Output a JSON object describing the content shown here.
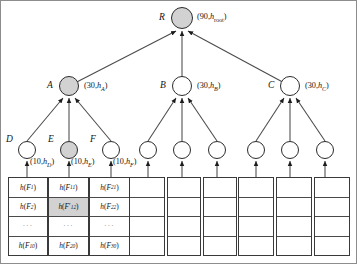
{
  "diagram": {
    "colors": {
      "shade": "#d2d2d2",
      "stroke": "#2b2b2b",
      "frame": "#8d8d8d"
    },
    "root": {
      "name": "R",
      "pair": "(90,h_root)",
      "shaded": true
    },
    "mid_nodes": [
      {
        "name": "A",
        "pair": "(30,h_A)",
        "shaded": true
      },
      {
        "name": "B",
        "pair": "(30,h_B)",
        "shaded": false
      },
      {
        "name": "C",
        "pair": "(30,h_C)",
        "shaded": false
      }
    ],
    "leaf_nodes": [
      {
        "name": "D",
        "pair": "(10,h_D)",
        "shaded": false
      },
      {
        "name": "E",
        "pair": "(10,h_E)",
        "shaded": true
      },
      {
        "name": "F",
        "pair": "(10,h_F)",
        "shaded": false
      },
      {
        "name": "",
        "pair": "",
        "shaded": false
      },
      {
        "name": "",
        "pair": "",
        "shaded": false
      },
      {
        "name": "",
        "pair": "",
        "shaded": false
      },
      {
        "name": "",
        "pair": "",
        "shaded": false
      },
      {
        "name": "",
        "pair": "",
        "shaded": false
      },
      {
        "name": "",
        "pair": "",
        "shaded": false
      }
    ],
    "tables": [
      {
        "cells": [
          "h(F_1)",
          "h(F_2)",
          "...",
          "h(F_10)"
        ],
        "shaded_index": -1
      },
      {
        "cells": [
          "h(F_11)",
          "h(F'_12)",
          "...",
          "h(F_20)"
        ],
        "shaded_index": 1
      },
      {
        "cells": [
          "h(F_21)",
          "h(F_22)",
          "...",
          "h(F_30)"
        ],
        "shaded_index": -1
      },
      {
        "cells": [
          "",
          "",
          "",
          ""
        ],
        "shaded_index": -1
      },
      {
        "cells": [
          "",
          "",
          "",
          ""
        ],
        "shaded_index": -1
      },
      {
        "cells": [
          "",
          "",
          "",
          ""
        ],
        "shaded_index": -1
      },
      {
        "cells": [
          "",
          "",
          "",
          ""
        ],
        "shaded_index": -1
      },
      {
        "cells": [
          "",
          "",
          "",
          ""
        ],
        "shaded_index": -1
      },
      {
        "cells": [
          "",
          "",
          "",
          ""
        ],
        "shaded_index": -1
      }
    ]
  }
}
